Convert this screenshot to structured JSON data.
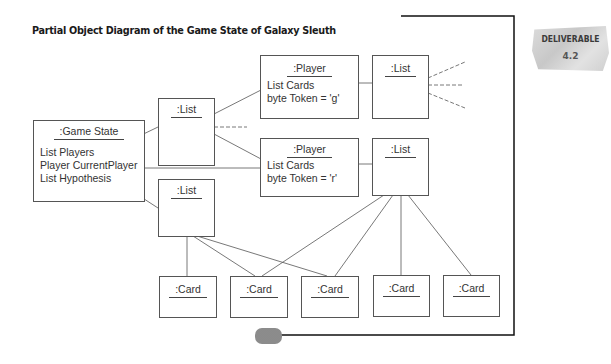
{
  "title": "Partial Object Diagram of the Game State of Galaxy Sleuth",
  "badge": {
    "label": "DELIVERABLE",
    "number": "4.2"
  },
  "objects": {
    "game_state": {
      "name": ":Game State",
      "attributes": [
        "List Players",
        "Player CurrentPlayer",
        "List Hypothesis"
      ]
    },
    "players_list": {
      "name": ":List"
    },
    "hypothesis_list": {
      "name": ":List"
    },
    "player_g": {
      "name": ":Player",
      "attributes": [
        "List Cards",
        "byte Token = 'g'"
      ]
    },
    "player_r": {
      "name": ":Player",
      "attributes": [
        "List Cards",
        "byte Token = 'r'"
      ]
    },
    "cards_list_g": {
      "name": ":List"
    },
    "cards_list_r": {
      "name": ":List"
    },
    "cards": [
      {
        "name": ":Card"
      },
      {
        "name": ":Card"
      },
      {
        "name": ":Card"
      },
      {
        "name": ":Card"
      },
      {
        "name": ":Card"
      }
    ]
  },
  "links": [
    {
      "from": "game_state.List Players",
      "to": "players_list",
      "style": "solid"
    },
    {
      "from": "game_state.Player CurrentPlayer",
      "to": "player_r",
      "style": "solid"
    },
    {
      "from": "game_state.List Hypothesis",
      "to": "hypothesis_list",
      "style": "solid"
    },
    {
      "from": "players_list",
      "to": "player_g",
      "style": "solid"
    },
    {
      "from": "players_list",
      "to": "player_r",
      "style": "solid"
    },
    {
      "from": "players_list",
      "to": "more",
      "style": "dashed"
    },
    {
      "from": "player_g.List Cards",
      "to": "cards_list_g",
      "style": "solid"
    },
    {
      "from": "player_r.List Cards",
      "to": "cards_list_r",
      "style": "solid"
    },
    {
      "from": "cards_list_g",
      "to": "more",
      "style": "dashed"
    },
    {
      "from": "cards_list_g",
      "to": "more",
      "style": "dashed"
    },
    {
      "from": "cards_list_g",
      "to": "more",
      "style": "dashed"
    },
    {
      "from": "hypothesis_list",
      "to": "cards.0",
      "style": "solid"
    },
    {
      "from": "hypothesis_list",
      "to": "cards.1",
      "style": "solid"
    },
    {
      "from": "hypothesis_list",
      "to": "cards.2",
      "style": "solid"
    },
    {
      "from": "cards_list_r",
      "to": "cards.1",
      "style": "solid"
    },
    {
      "from": "cards_list_r",
      "to": "cards.2",
      "style": "solid"
    },
    {
      "from": "cards_list_r",
      "to": "cards.3",
      "style": "solid"
    },
    {
      "from": "cards_list_r",
      "to": "cards.4",
      "style": "solid"
    }
  ]
}
